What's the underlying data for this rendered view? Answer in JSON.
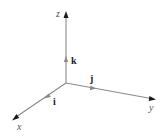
{
  "diagram": {
    "type": "3d-coordinate-axes",
    "axes": [
      {
        "name": "z",
        "label": "z"
      },
      {
        "name": "y",
        "label": "y"
      },
      {
        "name": "x",
        "label": "x"
      }
    ],
    "unit_vectors": [
      {
        "name": "k",
        "label": "k",
        "axis": "z"
      },
      {
        "name": "j",
        "label": "j",
        "axis": "y"
      },
      {
        "name": "i",
        "label": "i",
        "axis": "x"
      }
    ],
    "colors": {
      "axis_line": "#8a8a8a",
      "axis_arrowhead": "#1a1a1a",
      "background": "#ffffff"
    }
  }
}
